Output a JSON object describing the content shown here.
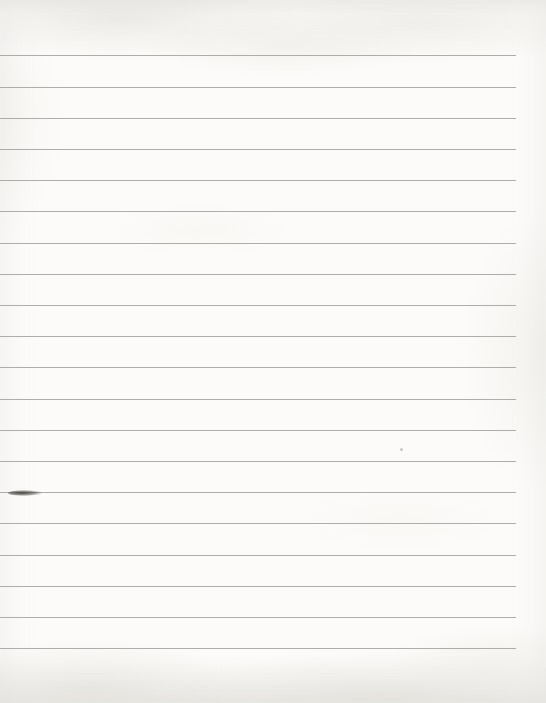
{
  "document": {
    "description": "Scanned blank sheet of ruled (lined) notebook paper with no visible writing or text",
    "paper_color": "#fcfbf9",
    "rule_color": "#a3a29e",
    "rules": {
      "count": 20,
      "first_y": 55.4,
      "spacing": 31.2,
      "left": 0,
      "right_end": 516
    },
    "marks": [
      {
        "kind": "ink-smudge",
        "x": 8,
        "y": 490,
        "width": 34,
        "height": 6,
        "note": "small dark ink/pen smudge lying on the 15th rule near the left edge"
      },
      {
        "kind": "paper-speck",
        "x": 400,
        "y": 448,
        "width": 3,
        "height": 3,
        "note": "tiny faint speck between rules"
      }
    ]
  }
}
